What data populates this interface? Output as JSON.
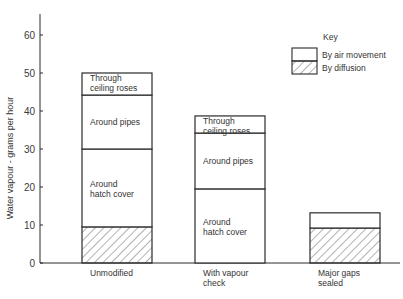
{
  "chart_data": {
    "type": "bar",
    "stacked": true,
    "title": "",
    "xlabel": "",
    "ylabel": "Water vapour - grams per hour",
    "ylim": [
      0,
      65
    ],
    "yticks": [
      0,
      10,
      20,
      30,
      40,
      50,
      60
    ],
    "grid": false,
    "legend_position": "top-right",
    "categories": [
      "Unmodified",
      "With vapour check",
      "Major gaps sealed"
    ],
    "category_label_lines": [
      [
        "Unmodified"
      ],
      [
        "With vapour",
        "check"
      ],
      [
        "Major gaps",
        "sealed"
      ]
    ],
    "bars": [
      {
        "category": "Unmodified",
        "total": 50,
        "segments": [
          {
            "label": "",
            "type": "By diffusion",
            "from": 0,
            "to": 9.5,
            "value": 9.5
          },
          {
            "label": "Around hatch cover",
            "type": "By air movement",
            "from": 9.5,
            "to": 30,
            "value": 20.5
          },
          {
            "label": "Around pipes",
            "type": "By air movement",
            "from": 30,
            "to": 44.2,
            "value": 14.2
          },
          {
            "label": "Through ceiling roses",
            "type": "By air movement",
            "from": 44.2,
            "to": 50,
            "value": 5.8
          }
        ]
      },
      {
        "category": "With vapour check",
        "total": 38.7,
        "segments": [
          {
            "label": "Around hatch cover",
            "type": "By air movement",
            "from": 0,
            "to": 19.5,
            "value": 19.5
          },
          {
            "label": "Around pipes",
            "type": "By air movement",
            "from": 19.5,
            "to": 34.2,
            "value": 14.7
          },
          {
            "label": "Through ceiling roses",
            "type": "By air movement",
            "from": 34.2,
            "to": 38.7,
            "value": 4.5
          }
        ]
      },
      {
        "category": "Major gaps sealed",
        "total": 13.2,
        "segments": [
          {
            "label": "",
            "type": "By diffusion",
            "from": 0,
            "to": 9.2,
            "value": 9.2
          },
          {
            "label": "",
            "type": "By air movement",
            "from": 9.2,
            "to": 13.2,
            "value": 4.0
          }
        ]
      }
    ],
    "series": [
      {
        "name": "By air movement",
        "pattern": "plain",
        "values": [
          40.5,
          38.7,
          4.0
        ]
      },
      {
        "name": "By diffusion",
        "pattern": "hatched",
        "values": [
          9.5,
          0,
          9.2
        ]
      }
    ],
    "legend": {
      "title": "Key",
      "entries": [
        {
          "label": "By air movement",
          "pattern": "plain"
        },
        {
          "label": "By diffusion",
          "pattern": "hatched"
        }
      ]
    },
    "colors": {
      "line": "#2a2a2a",
      "fill": "#ffffff",
      "hatch": "#555555"
    }
  }
}
